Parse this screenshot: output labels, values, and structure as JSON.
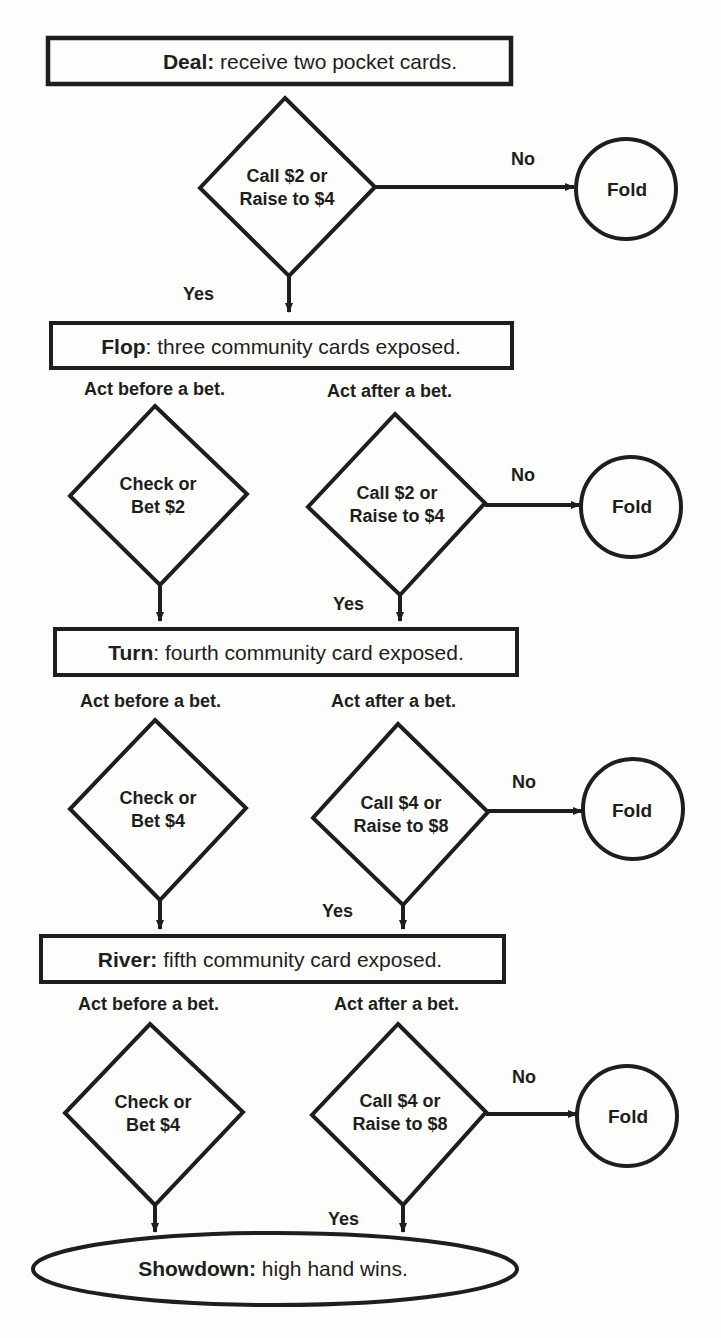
{
  "diagram": {
    "stages": [
      {
        "id": "deal",
        "name": "Deal:",
        "text": " receive two pocket cards."
      },
      {
        "id": "flop",
        "name": "Flop",
        "text": ": three community cards exposed."
      },
      {
        "id": "turn",
        "name": "Turn",
        "text": ": fourth community card exposed."
      },
      {
        "id": "river",
        "name": "River:",
        "text": " fifth community card exposed."
      },
      {
        "id": "showdown",
        "name": "Showdown:",
        "text": " high hand wins."
      }
    ],
    "act_labels": {
      "before": "Act before a bet.",
      "after": "Act after a bet."
    },
    "decisions": {
      "deal": {
        "line1": "Call $2 or",
        "line2": "Raise to $4"
      },
      "flop_before": {
        "line1": "Check or",
        "line2": "Bet $2"
      },
      "flop_after": {
        "line1": "Call $2 or",
        "line2": "Raise to $4"
      },
      "turn_before": {
        "line1": "Check or",
        "line2": "Bet $4"
      },
      "turn_after": {
        "line1": "Call $4 or",
        "line2": "Raise to $8"
      },
      "river_before": {
        "line1": "Check or",
        "line2": "Bet $4"
      },
      "river_after": {
        "line1": "Call $4 or",
        "line2": "Raise to $8"
      }
    },
    "edge_labels": {
      "yes": "Yes",
      "no": "No"
    },
    "terminal": {
      "fold": "Fold"
    },
    "colors": {
      "stroke": "#1e1e1e",
      "background": "#fdfdfb"
    }
  }
}
